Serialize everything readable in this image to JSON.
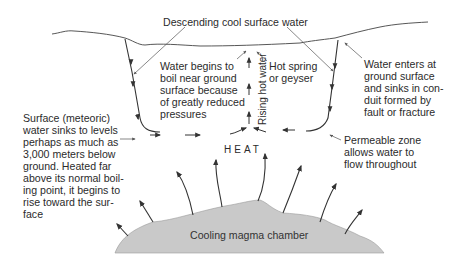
{
  "diagram": {
    "labels": {
      "descending": "Descending cool surface water",
      "water_begins": "Water begins to\nboil near ground\nsurface because\nof greatly reduced\npressures",
      "hot_spring": "Hot spring\nor geyser",
      "water_enters": "Water enters at\nground surface\nand sinks in con-\nduit formed by\nfault or fracture",
      "surface_meteoric": "Surface (meteoric)\nwater sinks to levels\nperhaps as much as\n3,000 meters below\nground. Heated far\nabove its normal boil-\ning point, it begins to\nrise toward the sur-\nface",
      "permeable_zone": "Permeable zone\nallows water to\nflow throughout",
      "heat": "HEAT",
      "rising_hot_water": "Rising hot water",
      "magma_chamber": "Cooling magma chamber"
    },
    "colors": {
      "line": "#333333",
      "magma_fill": "#c8c8c8",
      "leader": "#555555"
    }
  }
}
